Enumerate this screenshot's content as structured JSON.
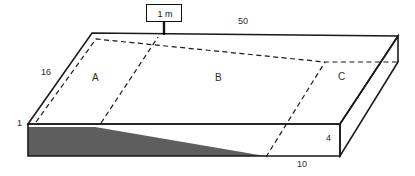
{
  "diagram": {
    "type": "isometric-block-section",
    "callout": {
      "label": "1 m",
      "name": "thickness-callout"
    },
    "dimensions": {
      "top_length": "50",
      "left_slope": "16",
      "left_height": "1",
      "right_height": "4",
      "bottom_length": "10"
    },
    "regions": [
      {
        "id": "A",
        "label": "A"
      },
      {
        "id": "B",
        "label": "B"
      },
      {
        "id": "C",
        "label": "C"
      }
    ],
    "colors": {
      "line": "#1a1a1a",
      "fill_shaded": "#5e5e5e",
      "background": "#ffffff"
    }
  }
}
